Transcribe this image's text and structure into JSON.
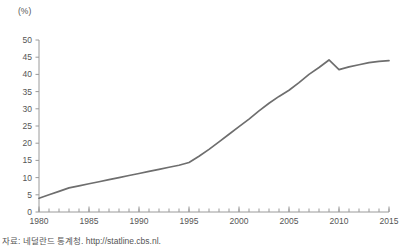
{
  "axis_unit_label": "(%)",
  "source_note": "자료: 네덜란드 통계청. http://statline.cbs.nl.",
  "colors": {
    "line": "#6e6e6e",
    "axis": "#9a9a9a",
    "text": "#555555",
    "background": "#ffffff"
  },
  "chart_data": {
    "type": "line",
    "title": "",
    "subtitle": "",
    "xlabel": "",
    "ylabel": "(%)",
    "ylim": [
      0,
      50
    ],
    "xlim": [
      1980,
      2015
    ],
    "ytick_labels": [
      "0",
      "5",
      "10",
      "15",
      "20",
      "25",
      "30",
      "35",
      "40",
      "45",
      "50"
    ],
    "yticks": [
      0,
      5,
      10,
      15,
      20,
      25,
      30,
      35,
      40,
      45,
      50
    ],
    "xtick_labels": [
      "1980",
      "1985",
      "1990",
      "1995",
      "2000",
      "2005",
      "2010",
      "2015"
    ],
    "xticks": [
      1980,
      1985,
      1990,
      1995,
      2000,
      2005,
      2010,
      2015
    ],
    "xminor_tick_step": 1,
    "grid": false,
    "legend": "none",
    "x": [
      1980,
      1981,
      1982,
      1983,
      1984,
      1985,
      1986,
      1987,
      1988,
      1989,
      1990,
      1991,
      1992,
      1993,
      1994,
      1995,
      1996,
      1997,
      1998,
      1999,
      2000,
      2001,
      2002,
      2003,
      2004,
      2005,
      2006,
      2007,
      2008,
      2009,
      2010,
      2011,
      2012,
      2013,
      2014,
      2015
    ],
    "series": [
      {
        "name": "Share",
        "values": [
          4.0,
          5.0,
          6.0,
          7.0,
          7.6,
          8.2,
          8.8,
          9.4,
          10.0,
          10.6,
          11.2,
          11.8,
          12.4,
          13.0,
          13.6,
          14.4,
          16.2,
          18.2,
          20.4,
          22.6,
          24.8,
          27.0,
          29.4,
          31.6,
          33.6,
          35.4,
          37.6,
          40.0,
          42.0,
          44.2,
          41.4,
          42.2,
          42.8,
          43.4,
          43.8,
          44.0
        ]
      }
    ]
  }
}
